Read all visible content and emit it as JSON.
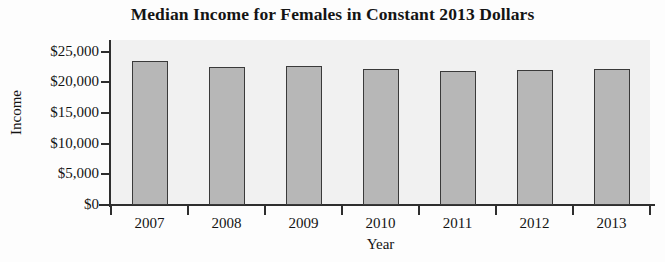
{
  "chart_data": {
    "type": "bar",
    "title": "Median Income for Females in Constant 2013 Dollars",
    "xlabel": "Year",
    "ylabel": "Income",
    "categories": [
      "2007",
      "2008",
      "2009",
      "2010",
      "2011",
      "2012",
      "2013"
    ],
    "values": [
      23450,
      22470,
      22640,
      22150,
      21800,
      22000,
      22150
    ],
    "ylim": [
      0,
      25000
    ],
    "ytick_values": [
      0,
      5000,
      10000,
      15000,
      20000,
      25000
    ],
    "ytick_labels": [
      "$0",
      "$5,000",
      "$10,000",
      "$15,000",
      "$20,000",
      "$25,000"
    ],
    "grid": false,
    "legend": null,
    "bar_color": "#b7b7b7",
    "bar_border_color": "#3a3a3a",
    "plot_background": "#f1f1f1",
    "axis_color": "#2e2e2e"
  }
}
